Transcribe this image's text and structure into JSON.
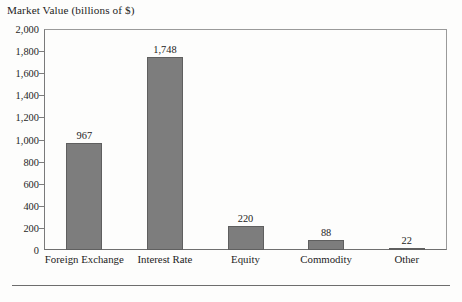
{
  "chart_data": {
    "type": "bar",
    "title": "Market Value (billions of $)",
    "xlabel": "",
    "ylabel": "Market Value (billions of $)",
    "categories": [
      "Foreign Exchange",
      "Interest Rate",
      "Equity",
      "Commodity",
      "Other"
    ],
    "values": [
      967,
      1748,
      220,
      88,
      22
    ],
    "value_labels": [
      "967",
      "1,748",
      "220",
      "88",
      "22"
    ],
    "ylim": [
      0,
      2000
    ],
    "ytick_values": [
      0,
      200,
      400,
      600,
      800,
      1000,
      1200,
      1400,
      1600,
      1800,
      2000
    ],
    "ytick_labels": [
      "0",
      "200",
      "400",
      "600",
      "800",
      "1,000",
      "1,200",
      "1,400",
      "1,600",
      "1,800",
      "2,000"
    ],
    "grid": false,
    "legend": false,
    "legend_position": "none",
    "bar_color": "#7d7d7d",
    "bar_edge_color": "#5f5f5f",
    "frame_color": "#8e8e8e",
    "background_color": "#fdfdfc",
    "text_color": "#232323"
  }
}
